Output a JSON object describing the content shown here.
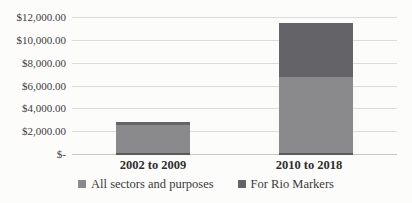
{
  "chart_data": {
    "type": "bar",
    "stacked": true,
    "title": "",
    "xlabel": "",
    "ylabel": "",
    "categories": [
      "2002 to 2009",
      "2010 to 2018"
    ],
    "series": [
      {
        "name": "All sectors and purposes",
        "values": [
          2650,
          6850
        ],
        "color": "#8a8a8d"
      },
      {
        "name": "For Rio Markers",
        "values": [
          250,
          4700
        ],
        "color": "#646468"
      }
    ],
    "totals": [
      2900,
      11550
    ],
    "ylim": [
      0,
      12000
    ],
    "ytick_step": 2000,
    "ytick_labels": [
      "$-",
      "$2,000.00",
      "$4,000.00",
      "$6,000.00",
      "$8,000.00",
      "$10,000.00",
      "$12,000.00"
    ],
    "grid": true,
    "legend_position": "bottom"
  },
  "colors": {
    "gridline": "#dcdcda",
    "axis_baseline": "#c6c6c4",
    "bar_bottom_edge": "#5a5a5e",
    "tick_text": "#3d3d3d",
    "category_text": "#2e2e2e",
    "background": "#fcfcfb"
  }
}
